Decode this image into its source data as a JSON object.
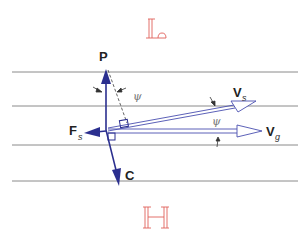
{
  "diagram": {
    "top_symbol": "𝕃",
    "bottom_symbol": "ℍ",
    "labels": {
      "P": "P",
      "C": "C",
      "F": "F",
      "F_sub": "s",
      "Vs": "V",
      "Vs_sub": "s",
      "Vg": "V",
      "Vg_sub": "g",
      "psi_top": "ψ",
      "psi_right": "ψ"
    },
    "horizontal_lines_y": [
      72,
      106,
      145,
      181
    ],
    "colors": {
      "vector": "#2b2f8f",
      "hollow_vector": "#4a4fb0",
      "grid_line": "#8a8a8a",
      "symbol": "#e0605a",
      "text": "#222222"
    }
  }
}
